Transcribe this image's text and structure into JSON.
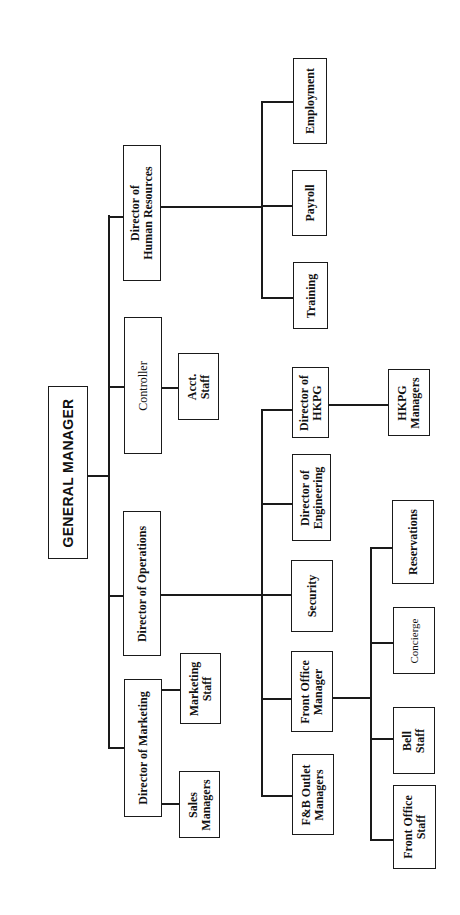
{
  "chart": {
    "type": "org-chart",
    "orientation": "rotated 90deg counter-clockwise (root at left, reads bottom-to-top)",
    "root": {
      "id": "gm",
      "label": "GENERAL MANAGER",
      "children": [
        {
          "id": "hr",
          "label": "Director of\nHuman Resources",
          "children": [
            {
              "id": "employment",
              "label": "Employment"
            },
            {
              "id": "payroll",
              "label": "Payroll"
            },
            {
              "id": "training",
              "label": "Training"
            }
          ]
        },
        {
          "id": "controller",
          "label": "Controller",
          "children": [
            {
              "id": "acct",
              "label": "Acct.\nStaff"
            }
          ]
        },
        {
          "id": "ops",
          "label": "Director of Operations",
          "children": [
            {
              "id": "hkpg",
              "label": "Director of\nHKPG",
              "children": [
                {
                  "id": "hkpgmgr",
                  "label": "HKPG\nManagers"
                }
              ]
            },
            {
              "id": "eng",
              "label": "Director of\nEngineering"
            },
            {
              "id": "security",
              "label": "Security"
            },
            {
              "id": "fom",
              "label": "Front Office\nManager",
              "children": [
                {
                  "id": "reservations",
                  "label": "Reservations"
                },
                {
                  "id": "concierge",
                  "label": "Concierge"
                },
                {
                  "id": "bell",
                  "label": "Bell\nStaff"
                },
                {
                  "id": "fostaff",
                  "label": "Front Office\nStaff"
                }
              ]
            },
            {
              "id": "fb",
              "label": "F&B Outlet\nManagers"
            }
          ]
        },
        {
          "id": "mkt",
          "label": "Director of Marketing",
          "children": [
            {
              "id": "mktstaff",
              "label": "Marketing\nStaff"
            },
            {
              "id": "sales",
              "label": "Sales\nManagers"
            }
          ]
        }
      ]
    }
  },
  "labels": {
    "gm": "GENERAL MANAGER",
    "hr": "Director of\nHuman Resources",
    "employment": "Employment",
    "payroll": "Payroll",
    "training": "Training",
    "controller": "Controller",
    "acct": "Acct.\nStaff",
    "ops": "Director of Operations",
    "hkpg": "Director of\nHKPG",
    "hkpgmgr": "HKPG\nManagers",
    "eng": "Director of\nEngineering",
    "security": "Security",
    "fom": "Front Office\nManager",
    "reservations": "Reservations",
    "concierge": "Concierge",
    "bell": "Bell\nStaff",
    "fostaff": "Front Office\nStaff",
    "fb": "F&B Outlet\nManagers",
    "mkt": "Director of Marketing",
    "mktstaff": "Marketing\nStaff",
    "sales": "Sales\nManagers"
  },
  "colors": {
    "line": "#1a1a1a",
    "background": "#ffffff",
    "text": "#111111"
  }
}
